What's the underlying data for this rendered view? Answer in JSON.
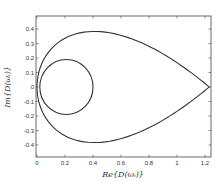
{
  "chart_data": {
    "type": "line",
    "title": "",
    "xlabel": "Re{D(ω₁)}",
    "ylabel": "Im{D(ω₁)}",
    "xlim": [
      0,
      1.24
    ],
    "ylim": [
      -0.48,
      0.49
    ],
    "grid": false,
    "legend": null,
    "x_ticks": [
      "0",
      "0.2",
      "0.4",
      "0.6",
      "0.8",
      "1",
      "1.2"
    ],
    "y_ticks": [
      "0.4",
      "0.3",
      "0.2",
      "0.1",
      "0",
      "-0.1",
      "-0.2",
      "-0.3",
      "-0.4"
    ],
    "series": [
      {
        "name": "outer-contour",
        "description": "teardrop-shaped closed curve from origin to (1.23, 0)",
        "x": [
          0,
          0.02,
          0.05,
          0.1,
          0.2,
          0.3,
          0.45,
          0.6,
          0.8,
          1.0,
          1.15,
          1.23,
          1.15,
          1.0,
          0.8,
          0.6,
          0.45,
          0.3,
          0.2,
          0.1,
          0.05,
          0.02,
          0
        ],
        "y": [
          0,
          0.12,
          0.2,
          0.29,
          0.37,
          0.41,
          0.42,
          0.4,
          0.33,
          0.21,
          0.09,
          0,
          -0.09,
          -0.21,
          -0.33,
          -0.4,
          -0.42,
          -0.41,
          -0.37,
          -0.29,
          -0.2,
          -0.12,
          0
        ]
      },
      {
        "name": "inner-circle",
        "description": "circle centered near (0.21, 0) radius ~0.19",
        "center": [
          0.21,
          0
        ],
        "radius": 0.19
      }
    ]
  },
  "labels": {
    "xlabel_text": "Re{D(ωᵢ)}",
    "ylabel_text": "Im{D(ωᵢ)}"
  },
  "colors": {
    "line": "#333333",
    "axes": "#444444"
  }
}
